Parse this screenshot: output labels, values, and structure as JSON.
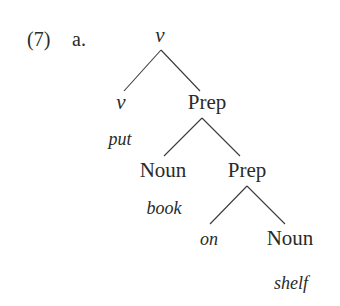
{
  "example": {
    "number": "(7)",
    "sub_label": "a."
  },
  "tree": {
    "root": {
      "label": "v",
      "italic": true
    },
    "nodes": [
      {
        "id": "root",
        "label": "v",
        "italic": true
      },
      {
        "id": "v_head",
        "label": "v",
        "italic": true,
        "word": "put"
      },
      {
        "id": "prep1",
        "label": "Prep"
      },
      {
        "id": "noun1",
        "label": "Noun",
        "word": "book"
      },
      {
        "id": "prep2",
        "label": "Prep"
      },
      {
        "id": "on",
        "label": "on",
        "italic": true
      },
      {
        "id": "noun2",
        "label": "Noun",
        "word": "shelf"
      }
    ],
    "edges": [
      [
        "root",
        "v_head"
      ],
      [
        "root",
        "prep1"
      ],
      [
        "prep1",
        "noun1"
      ],
      [
        "prep1",
        "prep2"
      ],
      [
        "prep2",
        "on"
      ],
      [
        "prep2",
        "noun2"
      ]
    ],
    "labels": {
      "root": "v",
      "v_head": "v",
      "v_head_word": "put",
      "prep1": "Prep",
      "noun1": "Noun",
      "noun1_word": "book",
      "prep2": "Prep",
      "on": "on",
      "noun2": "Noun",
      "noun2_word": "shelf"
    }
  }
}
